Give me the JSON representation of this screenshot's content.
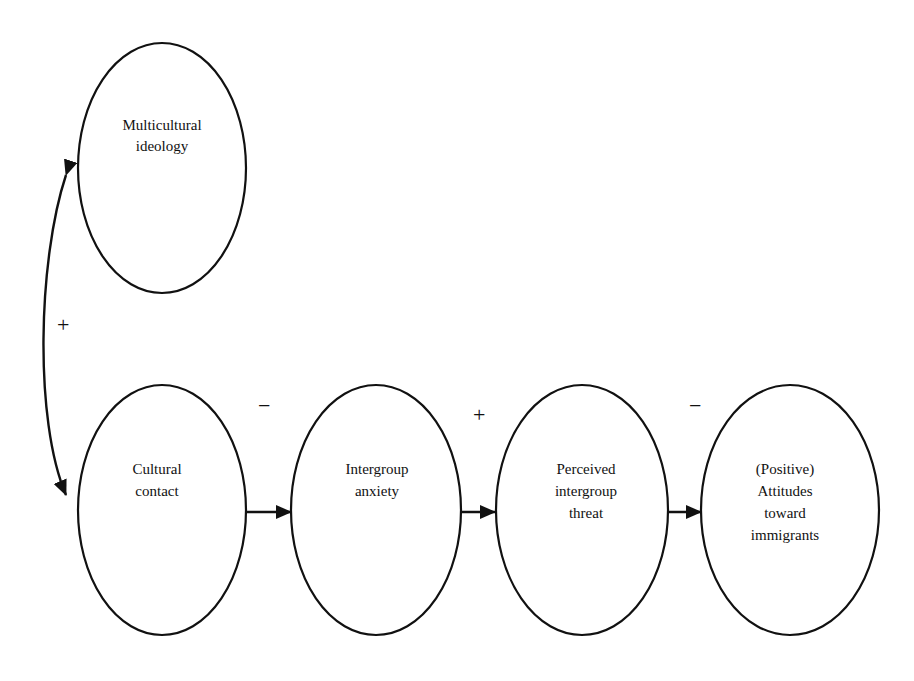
{
  "diagram": {
    "type": "path-model",
    "nodes": [
      {
        "id": "multicultural",
        "label_lines": [
          "Multicultural",
          "ideology"
        ],
        "cx": 162,
        "cy": 168,
        "rx": 84,
        "ry": 125
      },
      {
        "id": "contact",
        "label_lines": [
          "Cultural",
          "contact"
        ],
        "cx": 162,
        "cy": 510,
        "rx": 84,
        "ry": 125
      },
      {
        "id": "anxiety",
        "label_lines": [
          "Intergroup",
          "anxiety"
        ],
        "cx": 376,
        "cy": 510,
        "rx": 85,
        "ry": 125
      },
      {
        "id": "threat",
        "label_lines": [
          "Perceived",
          "intergroup",
          "threat"
        ],
        "cx": 582,
        "cy": 510,
        "rx": 86,
        "ry": 125
      },
      {
        "id": "attitudes",
        "label_lines": [
          "(Positive)",
          "Attitudes",
          "toward",
          "immigrants"
        ],
        "cx": 790,
        "cy": 510,
        "rx": 89,
        "ry": 125
      }
    ],
    "edges": [
      {
        "from": "multicultural",
        "to": "contact",
        "type": "bidirectional-curved",
        "sign": "+"
      },
      {
        "from": "contact",
        "to": "anxiety",
        "type": "directed",
        "sign": "−"
      },
      {
        "from": "anxiety",
        "to": "threat",
        "type": "directed",
        "sign": "+"
      },
      {
        "from": "threat",
        "to": "attitudes",
        "type": "directed",
        "sign": "−"
      }
    ],
    "signs": {
      "correlation": "+",
      "contact_to_anxiety": "−",
      "anxiety_to_threat": "+",
      "threat_to_attitudes": "−"
    },
    "colors": {
      "stroke": "#111111",
      "background": "#ffffff"
    }
  }
}
